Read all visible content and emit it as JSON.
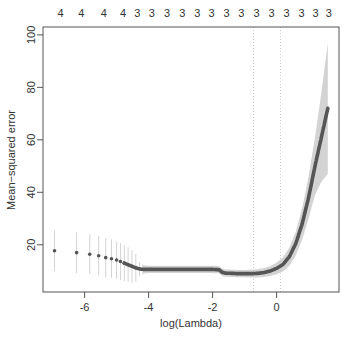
{
  "chart_data": {
    "type": "scatter",
    "title": "",
    "xlabel": "log(Lambda)",
    "ylabel": "Mean−squared error",
    "xlim": [
      -7.3,
      1.95
    ],
    "ylim": [
      2,
      103
    ],
    "x_ticks": [
      -6,
      -4,
      -2,
      0
    ],
    "x_tick_labels": [
      "-6",
      "-4",
      "-2",
      "0"
    ],
    "y_ticks": [
      20,
      40,
      60,
      80,
      100
    ],
    "y_tick_labels": [
      "20",
      "40",
      "60",
      "80",
      "100"
    ],
    "top_axis_label": "number of nonzero coefficients",
    "top_ticks": {
      "x": [
        -6.75,
        -6.1,
        -5.4,
        -4.8,
        -4.35,
        -3.9,
        -3.42,
        -2.95,
        -2.48,
        -2.03,
        -1.56,
        -1.1,
        -0.63,
        -0.16,
        0.31,
        0.78,
        1.22,
        1.63
      ],
      "labels": [
        "4",
        "4",
        "4",
        "4",
        "3",
        "3",
        "3",
        "3",
        "3",
        "3",
        "3",
        "3",
        "3",
        "3",
        "3",
        "3",
        "3",
        "3"
      ]
    },
    "vlines": [
      {
        "name": "lambda.min",
        "x": -0.72
      },
      {
        "name": "lambda.1se",
        "x": 0.12
      }
    ],
    "grid": false,
    "legend": null,
    "series": [
      {
        "name": "CV mean-squared error",
        "x": [
          -6.94,
          -6.25,
          -5.84,
          -5.56,
          -5.34,
          -5.16,
          -5.0,
          -4.88,
          -4.76,
          -4.64,
          -4.52,
          -4.4,
          -4.28,
          -4.16,
          -4.0,
          -3.6,
          -3.2,
          -2.8,
          -2.4,
          -2.0,
          -1.8,
          -1.7,
          -1.6,
          -1.4,
          -1.2,
          -1.0,
          -0.8,
          -0.6,
          -0.4,
          -0.2,
          0.0,
          0.2,
          0.4,
          0.6,
          0.8,
          1.0,
          1.2,
          1.4,
          1.6
        ],
        "y": [
          17.7,
          17.0,
          16.4,
          15.8,
          15.1,
          14.7,
          14.2,
          13.6,
          13.0,
          12.4,
          11.8,
          11.2,
          10.8,
          10.6,
          10.6,
          10.6,
          10.6,
          10.6,
          10.6,
          10.6,
          10.5,
          9.5,
          9.2,
          9.1,
          9.0,
          9.0,
          9.0,
          9.1,
          9.4,
          10.0,
          11.0,
          12.5,
          15.5,
          20.5,
          28.0,
          38.0,
          50.0,
          61.0,
          72.0
        ],
        "upper": [
          25.5,
          24.8,
          24.0,
          23.3,
          22.5,
          22.0,
          21.3,
          20.6,
          19.8,
          19.0,
          18.0,
          16.5,
          13.5,
          12.2,
          12.0,
          12.0,
          12.0,
          12.0,
          12.0,
          12.0,
          11.9,
          10.9,
          10.6,
          10.5,
          10.4,
          10.4,
          10.5,
          10.7,
          11.1,
          11.9,
          13.2,
          15.2,
          19.0,
          25.0,
          34.0,
          46.0,
          61.0,
          78.0,
          97.0
        ],
        "lower": [
          9.9,
          9.2,
          8.8,
          8.3,
          7.7,
          7.4,
          7.1,
          6.6,
          6.2,
          5.8,
          5.6,
          6.0,
          8.1,
          9.0,
          9.2,
          9.2,
          9.2,
          9.2,
          9.2,
          9.2,
          9.1,
          8.1,
          7.8,
          7.7,
          7.6,
          7.6,
          7.5,
          7.5,
          7.7,
          8.1,
          8.8,
          9.8,
          12.0,
          16.0,
          22.0,
          30.0,
          39.0,
          44.0,
          47.0
        ]
      }
    ],
    "colors": {
      "points": "#555555",
      "errorbar": "#d3d3d3",
      "vline": "#c8c8c8",
      "axis": "#555555",
      "text": "#333333"
    }
  }
}
